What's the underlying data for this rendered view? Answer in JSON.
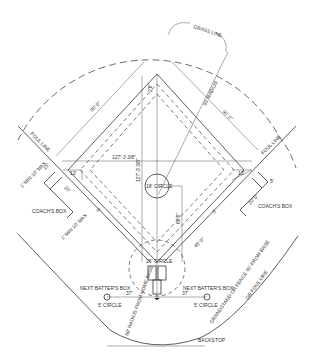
{
  "diagram": {
    "type": "baseball field layout",
    "labels": {
      "grass_line": "GRASS LINE",
      "radius_95": "95' RADIUS",
      "base_path_left": "90' 0\"",
      "base_path_right": "90' 0\"",
      "base_offset_top": "2'6\"",
      "foul_line_left": "FOUL LINE",
      "foul_line_right": "FOUL LINE",
      "diag_horizontal": "127'-3 3/8\"",
      "diag_vertical": "127'-3 3/8\"",
      "pitcher_circle": "18' CIRCLE",
      "home_circle": "26' CIRCLE",
      "pitch_distance": "60'6\"",
      "coach_offset_left": "13'",
      "coach_offset_right": "13'",
      "coach_len_left": "15'",
      "coach_box_left": "COACH'S BOX",
      "coach_box_right": "COACH'S BOX",
      "coach_min_max_left_top": "1' MIN 10' MAX",
      "coach_min_max_left_bottom": "1' MIN 10' MAX",
      "coach_dim_left": "20'",
      "coach_dim_right": "20' 0\"",
      "small_dim_right": "5'",
      "three_ft_left": "3'",
      "three_ft_right": "3'",
      "first_base_line_dim": "45' 0\"",
      "next_batter_box_left": "NEXT BATTER'S BOX",
      "next_batter_box_right": "NEXT BATTER'S BOX",
      "on_deck_dist_left": "37'",
      "on_deck_dist_right": "37'",
      "circle_left": "5' CIRCLE",
      "circle_right": "5' CIRCLE",
      "backstop_radius": "60' RADIUS FROM HOME BASE",
      "grandstand_line1": "GRANDSTAND OR FENCE 60' FROM BASE",
      "grandstand_line2": "OR FOUL LINE",
      "backstop": "BACKSTOP"
    }
  }
}
